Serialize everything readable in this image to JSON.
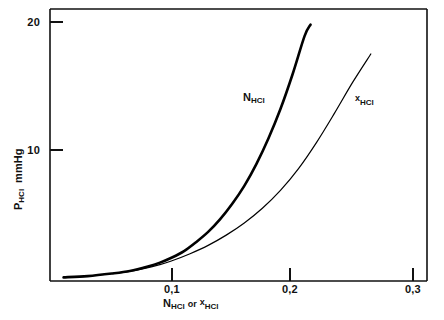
{
  "chart_data": {
    "type": "line",
    "title": "",
    "xlabel": "N_HCl or x_HCl",
    "ylabel": "P_HCl  mmHg",
    "xlim": [
      0.0,
      0.315
    ],
    "ylim": [
      0.0,
      20.8
    ],
    "grid": false,
    "legend": "inline-curve-labels",
    "x_ticks": [
      {
        "value": 0.1,
        "label": "0,1"
      },
      {
        "value": 0.2,
        "label": "0,2"
      },
      {
        "value": 0.3,
        "label": "0,3"
      }
    ],
    "y_ticks": [
      {
        "value": 10,
        "label": "10"
      },
      {
        "value": 20,
        "label": "20"
      }
    ],
    "series": [
      {
        "name": "N_HCl",
        "label": "N",
        "label_sub": "HCl",
        "linewidth": "thick",
        "color": "#000000",
        "x": [
          0.01,
          0.03,
          0.05,
          0.065,
          0.08,
          0.09,
          0.1,
          0.11,
          0.12,
          0.13,
          0.14,
          0.15,
          0.16,
          0.17,
          0.18,
          0.19,
          0.2,
          0.21,
          0.215
        ],
        "y": [
          0.05,
          0.15,
          0.35,
          0.55,
          0.9,
          1.2,
          1.6,
          2.1,
          2.8,
          3.6,
          4.6,
          5.8,
          7.2,
          8.9,
          10.9,
          13.2,
          15.9,
          18.9,
          19.8
        ]
      },
      {
        "name": "x_HCl",
        "label": "x",
        "label_sub": "HCl",
        "linewidth": "thin",
        "color": "#000000",
        "x": [
          0.01,
          0.03,
          0.05,
          0.07,
          0.09,
          0.1,
          0.115,
          0.13,
          0.145,
          0.16,
          0.175,
          0.19,
          0.205,
          0.22,
          0.235,
          0.25,
          0.265
        ],
        "y": [
          0.05,
          0.15,
          0.35,
          0.6,
          1.05,
          1.35,
          1.9,
          2.55,
          3.35,
          4.3,
          5.45,
          6.85,
          8.55,
          10.6,
          12.9,
          15.3,
          17.5
        ]
      }
    ],
    "annotations": [
      {
        "text": "N_HCl",
        "x": 0.145,
        "y": 13.5
      },
      {
        "text": "x_HCl",
        "x": 0.245,
        "y": 13.2
      }
    ]
  },
  "axes": {
    "y_title_main": "P",
    "y_title_sub": "HCl",
    "y_title_units": "mmHg",
    "x_title_first_main": "N",
    "x_title_first_sub": "HCl",
    "x_title_conjunction": "or",
    "x_title_second_main": "x",
    "x_title_second_sub": "HCl"
  },
  "curve_labels": {
    "first_main": "N",
    "first_sub": "HCl",
    "second_main": "x",
    "second_sub": "HCl"
  },
  "ticks": {
    "y": [
      "20",
      "10"
    ],
    "x": [
      "0,1",
      "0,2",
      "0,3"
    ]
  },
  "colors": {
    "background": "#ffffff",
    "ink": "#111111",
    "curve": "#000000"
  }
}
